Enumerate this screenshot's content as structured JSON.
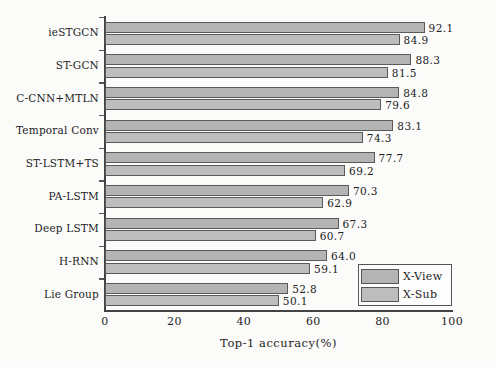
{
  "chart_data": {
    "type": "bar",
    "orientation": "horizontal",
    "title": "",
    "xlabel": "Top-1 accuracy(%)",
    "ylabel": "",
    "xlim": [
      0,
      100
    ],
    "xticks": [
      0,
      20,
      40,
      60,
      80,
      100
    ],
    "grid": false,
    "legend_position": "lower-right",
    "categories": [
      "ieSTGCN",
      "ST-GCN",
      "C-CNN+MTLN",
      "Temporal Conv",
      "ST-LSTM+TS",
      "PA-LSTM",
      "Deep LSTM",
      "H-RNN",
      "Lie Group"
    ],
    "series": [
      {
        "name": "X-View",
        "color": "#b4b4b4",
        "values": [
          92.1,
          88.3,
          84.8,
          83.1,
          77.7,
          70.3,
          67.3,
          64.0,
          52.8
        ]
      },
      {
        "name": "X-Sub",
        "color": "#bdbdbd",
        "values": [
          84.9,
          81.5,
          79.6,
          74.3,
          69.2,
          62.9,
          60.7,
          59.1,
          50.1
        ]
      }
    ]
  },
  "legend": {
    "items": [
      {
        "label": "X-View",
        "swatch": "xview"
      },
      {
        "label": "X-Sub",
        "swatch": "xsub"
      }
    ]
  }
}
